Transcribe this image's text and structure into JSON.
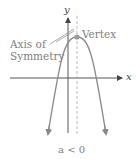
{
  "diagram": {
    "type": "parabola",
    "orientation": "opens-down",
    "labels": {
      "y_axis": "y",
      "x_axis": "x",
      "vertex": "Vertex",
      "axis_of_symmetry_line1": "Axis of",
      "axis_of_symmetry_line2": "Symmetry",
      "condition": "a < 0"
    },
    "colors": {
      "axes": "#555555",
      "curve": "#8a8a8a",
      "vertex_point": "#9a9a9a",
      "symmetry_line": "#aaaaaa",
      "text": "#808080"
    }
  }
}
